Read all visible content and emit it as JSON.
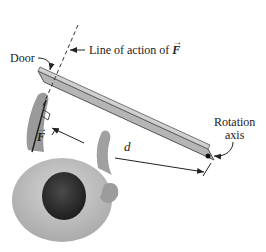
{
  "figure": {
    "labels": {
      "door": "Door",
      "line_of_action_prefix": "Line of action of ",
      "force_symbol": "F",
      "vector_arrow": "→",
      "distance_symbol": "d",
      "rotation_line1": "Rotation",
      "rotation_line2": "axis"
    },
    "colors": {
      "door_fill": "#b5b5b5",
      "door_stroke": "#555555",
      "person_body": "#a9a9a9",
      "person_head": "#2e2e2e",
      "line": "#222222"
    }
  }
}
